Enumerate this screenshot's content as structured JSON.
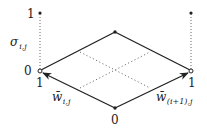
{
  "diagram": {
    "labels": {
      "left_top": "1",
      "left_bottom": "0",
      "left_axis": "σ",
      "left_axis_sub": "i,j",
      "left_vertex_below": "1",
      "right_vertex_below": "1",
      "bottom_vertex": "0",
      "left_edge": "w̄",
      "left_edge_sub": "i,j",
      "right_edge": "w̄",
      "right_edge_sub": "(i+1),j"
    },
    "colors": {
      "stroke": "#222222",
      "dotted": "#777777",
      "background": "#ffffff"
    }
  }
}
